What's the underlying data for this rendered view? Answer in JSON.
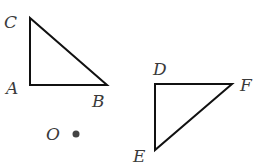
{
  "diagram": {
    "triangle_abc": {
      "labels": {
        "a": "A",
        "b": "B",
        "c": "C"
      }
    },
    "triangle_def": {
      "labels": {
        "d": "D",
        "e": "E",
        "f": "F"
      }
    },
    "point_o": {
      "label": "O"
    },
    "colors": {
      "stroke": "#111111",
      "label": "#3a3a3a",
      "dot": "#444444"
    }
  }
}
